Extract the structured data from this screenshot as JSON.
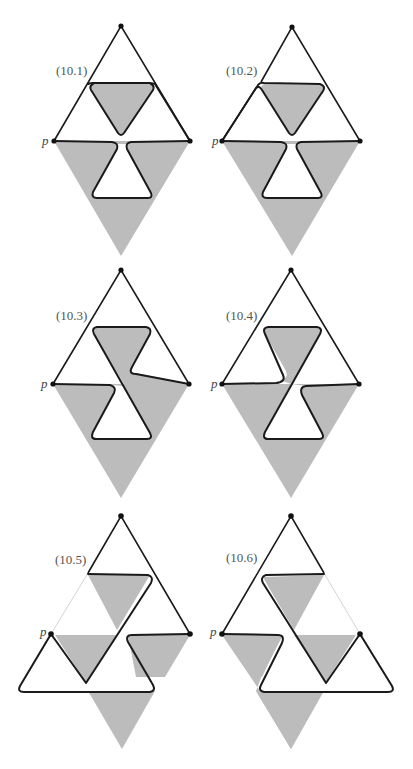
{
  "figure": {
    "shade_color": "#bcbcbc",
    "line_color": "#1a1a1a",
    "vertex_label": "p",
    "panels": [
      {
        "id": "10.1",
        "label": "(10.1)"
      },
      {
        "id": "10.2",
        "label": "(10.2)"
      },
      {
        "id": "10.3",
        "label": "(10.3)"
      },
      {
        "id": "10.4",
        "label": "(10.4)"
      },
      {
        "id": "10.5",
        "label": "(10.5)"
      },
      {
        "id": "10.6",
        "label": "(10.6)"
      }
    ]
  }
}
